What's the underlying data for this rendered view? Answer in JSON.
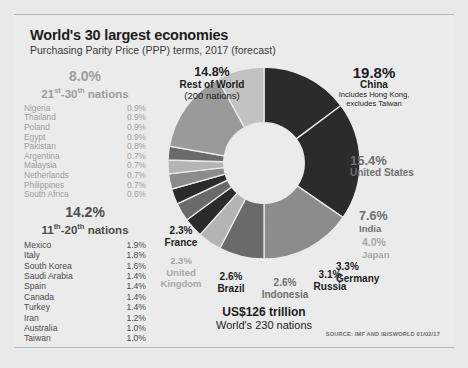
{
  "header": {
    "title": "World's 30 largest economies",
    "subtitle": "Purchasing Parity Price (PPP) terms, 2017 (forecast)"
  },
  "groups": [
    {
      "id": "g21",
      "percent": "8.0%",
      "range_prefix": "21",
      "range_sup1": "st",
      "range_mid": "-30",
      "range_sup2": "th",
      "range_suffix": " nations",
      "rows": [
        {
          "name": "Nigeria",
          "value": "0.9%"
        },
        {
          "name": "Thailand",
          "value": "0.9%"
        },
        {
          "name": "Poland",
          "value": "0.9%"
        },
        {
          "name": "Egypt",
          "value": "0.9%"
        },
        {
          "name": "Pakistan",
          "value": "0.8%"
        },
        {
          "name": "Argentina",
          "value": "0.7%"
        },
        {
          "name": "Malaysia",
          "value": "0.7%"
        },
        {
          "name": "Netherlands",
          "value": "0.7%"
        },
        {
          "name": "Philippines",
          "value": "0.7%"
        },
        {
          "name": "South Africa",
          "value": "0.6%"
        }
      ]
    },
    {
      "id": "g11",
      "percent": "14.2%",
      "range_prefix": "11",
      "range_sup1": "th",
      "range_mid": "-20",
      "range_sup2": "th",
      "range_suffix": " nations",
      "rows": [
        {
          "name": "Mexico",
          "value": "1.9%"
        },
        {
          "name": "Italy",
          "value": "1.8%"
        },
        {
          "name": "South Korea",
          "value": "1.6%"
        },
        {
          "name": "Saudi Arabia",
          "value": "1.4%"
        },
        {
          "name": "Spain",
          "value": "1.4%"
        },
        {
          "name": "Canada",
          "value": "1.4%"
        },
        {
          "name": "Turkey",
          "value": "1.4%"
        },
        {
          "name": "Iran",
          "value": "1.2%"
        },
        {
          "name": "Australia",
          "value": "1.0%"
        },
        {
          "name": "Taiwan",
          "value": "1.0%"
        }
      ]
    }
  ],
  "callouts": {
    "rest_of_world": {
      "percent": "14.8%",
      "name": "Rest of World",
      "sub": "(200 nations)"
    },
    "china": {
      "percent": "19.8%",
      "name": "China",
      "sub1": "Includes Hong Kong,",
      "sub2": "excludes Taiwan"
    },
    "united_states": {
      "percent": "15.4%",
      "name": "United States"
    },
    "india": {
      "percent": "7.6%",
      "name": "India"
    },
    "japan": {
      "percent": "4.0%",
      "name": "Japan"
    },
    "germany": {
      "percent": "3.3%",
      "name": "Germany"
    },
    "russia": {
      "percent": "3.1%",
      "name": "Russia"
    },
    "indonesia": {
      "percent": "2.6%",
      "name": "Indonesia"
    },
    "brazil": {
      "percent": "2.6%",
      "name": "Brazil"
    },
    "united_kingdom": {
      "percent": "2.3%",
      "name1": "United",
      "name2": "Kingdom"
    },
    "france": {
      "percent": "2.3%",
      "name": "France"
    }
  },
  "total": {
    "amount": "US$126 trillion",
    "caption": "World's 230 nations"
  },
  "source": "SOURCE: IMF AND IBISWORLD 01/02/17",
  "chart_data": {
    "type": "pie",
    "title": "World's 30 largest economies",
    "subtitle": "Purchasing Parity Price (PPP) terms, 2017 (forecast)",
    "units": "percent of world GDP (PPP)",
    "total_label": "US$126 trillion",
    "total_nations": "World's 230 nations",
    "donut": true,
    "inner_radius_ratio": 0.42,
    "start_angle_deg": -90,
    "direction": "clockwise",
    "legend": "callout-labels",
    "categories": [
      "Rest of World",
      "China",
      "United States",
      "India",
      "Japan",
      "Germany",
      "Russia",
      "Indonesia",
      "Brazil",
      "United Kingdom",
      "France",
      "11th-20th nations",
      "21st-30th nations"
    ],
    "values": [
      14.8,
      19.8,
      15.4,
      7.6,
      4.0,
      3.3,
      3.1,
      2.6,
      2.6,
      2.3,
      2.3,
      14.2,
      8.0
    ],
    "colors": [
      "#2b2b2b",
      "#2b2b2b",
      "#8c8c8c",
      "#6a6a6a",
      "#b4b4b4",
      "#2b2b2b",
      "#6a6a6a",
      "#2b2b2b",
      "#8c8c8c",
      "#b4b4b4",
      "#6a6a6a",
      "#9a9a9a",
      "#c2c2c2"
    ],
    "breakdown_21_30": {
      "total": 8.0,
      "items": [
        {
          "name": "Nigeria",
          "value": 0.9
        },
        {
          "name": "Thailand",
          "value": 0.9
        },
        {
          "name": "Poland",
          "value": 0.9
        },
        {
          "name": "Egypt",
          "value": 0.9
        },
        {
          "name": "Pakistan",
          "value": 0.8
        },
        {
          "name": "Argentina",
          "value": 0.7
        },
        {
          "name": "Malaysia",
          "value": 0.7
        },
        {
          "name": "Netherlands",
          "value": 0.7
        },
        {
          "name": "Philippines",
          "value": 0.7
        },
        {
          "name": "South Africa",
          "value": 0.6
        }
      ]
    },
    "breakdown_11_20": {
      "total": 14.2,
      "items": [
        {
          "name": "Mexico",
          "value": 1.9
        },
        {
          "name": "Italy",
          "value": 1.8
        },
        {
          "name": "South Korea",
          "value": 1.6
        },
        {
          "name": "Saudi Arabia",
          "value": 1.4
        },
        {
          "name": "Spain",
          "value": 1.4
        },
        {
          "name": "Canada",
          "value": 1.4
        },
        {
          "name": "Turkey",
          "value": 1.4
        },
        {
          "name": "Iran",
          "value": 1.2
        },
        {
          "name": "Australia",
          "value": 1.0
        },
        {
          "name": "Taiwan",
          "value": 1.0
        }
      ]
    }
  }
}
